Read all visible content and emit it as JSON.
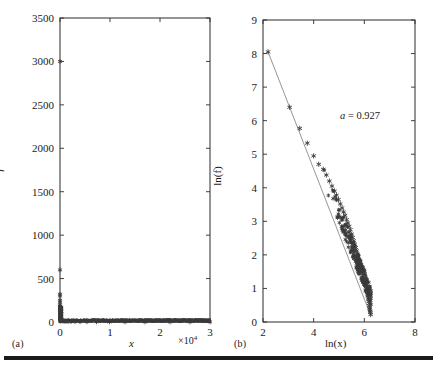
{
  "figure": {
    "panel_a_label": "(a)",
    "panel_b_label": "(b)"
  },
  "chart_data": [
    {
      "type": "scatter",
      "panel": "(a)",
      "title": "",
      "xlabel": "x",
      "ylabel": "f",
      "x_multiplier": "×10",
      "x_multiplier_exponent": "4",
      "xlim": [
        0,
        30000
      ],
      "ylim": [
        0,
        3500
      ],
      "xticks": [
        0,
        10000,
        20000,
        30000
      ],
      "xticklabels": [
        "0",
        "1",
        "2",
        "3"
      ],
      "yticks": [
        0,
        500,
        1000,
        1500,
        2000,
        2500,
        3000,
        3500
      ],
      "yticklabels": [
        "0",
        "500",
        "1000",
        "1500",
        "2000",
        "2500",
        "3000",
        "3500"
      ],
      "grid": false,
      "legend": "none",
      "marker": "star",
      "marker_color": "#3a3a3a",
      "description": "Rank-frequency distribution: frequency f versus rank x, heavy-tailed decay",
      "x": [
        1,
        2,
        3,
        4,
        5,
        6,
        7,
        8,
        9,
        10,
        12,
        14,
        17,
        20,
        25,
        30,
        40,
        55,
        75,
        100,
        140,
        190,
        260,
        350,
        470,
        640,
        870,
        1200,
        1600,
        2200,
        3000,
        4000,
        5400,
        7300,
        9900,
        13000,
        17000,
        22000,
        26000,
        30000
      ],
      "values": [
        3000,
        600,
        320,
        300,
        250,
        230,
        200,
        185,
        170,
        155,
        140,
        125,
        110,
        100,
        88,
        78,
        66,
        55,
        45,
        37,
        30,
        25,
        20,
        17,
        14,
        11,
        9,
        7,
        6,
        5,
        4,
        3,
        2.5,
        2,
        1.6,
        1.3,
        1.1,
        1,
        1,
        1
      ]
    },
    {
      "type": "scatter",
      "panel": "(b)",
      "title": "",
      "xlabel": "ln(x)",
      "ylabel": "ln(f)",
      "xlim": [
        2,
        8
      ],
      "ylim": [
        0,
        9
      ],
      "xticks": [
        2,
        4,
        6,
        8
      ],
      "xticklabels": [
        "2",
        "4",
        "6",
        "8"
      ],
      "yticks": [
        0,
        1,
        2,
        3,
        4,
        5,
        6,
        7,
        8,
        9
      ],
      "yticklabels": [
        "0",
        "1",
        "2",
        "3",
        "4",
        "5",
        "6",
        "7",
        "8",
        "9"
      ],
      "grid": false,
      "legend": "none",
      "marker": "star",
      "marker_color": "#3a3a3a",
      "fit_line_color": "#8a8a8a",
      "annotation": {
        "variable": "a",
        "equals": " = ",
        "value": "0.927"
      },
      "annotation_text": "a = 0.927",
      "fit": {
        "x": [
          2.2,
          6.25
        ],
        "y": [
          8.05,
          0.2
        ]
      },
      "x": [
        2.2,
        3.05,
        3.45,
        3.75,
        4.0,
        4.2,
        4.38,
        4.5,
        4.62,
        4.72,
        4.82,
        4.9,
        4.98,
        5.05,
        5.12,
        5.18,
        5.24,
        5.3,
        5.35,
        5.4,
        5.45,
        5.5,
        5.54,
        5.58,
        5.62,
        5.66,
        5.7,
        5.73,
        5.76,
        5.79,
        5.82,
        5.85,
        5.88,
        5.9,
        5.93,
        5.95,
        5.98,
        6.0,
        6.02,
        6.04,
        6.06,
        6.08,
        6.1,
        6.11,
        6.13,
        6.14,
        6.16,
        6.17,
        6.18,
        6.19,
        6.2,
        6.21,
        6.22,
        6.23,
        6.24,
        6.25
      ],
      "values": [
        8.05,
        6.4,
        5.77,
        5.33,
        4.95,
        4.7,
        4.55,
        4.38,
        4.2,
        4.05,
        3.9,
        3.78,
        3.65,
        3.52,
        3.4,
        3.28,
        3.18,
        3.05,
        2.95,
        2.85,
        2.75,
        2.62,
        2.52,
        2.42,
        2.32,
        2.22,
        2.12,
        2.02,
        1.95,
        1.85,
        1.78,
        1.7,
        1.62,
        1.55,
        1.48,
        1.4,
        1.32,
        1.25,
        1.18,
        1.12,
        1.05,
        0.98,
        0.92,
        0.88,
        0.82,
        0.78,
        0.72,
        0.68,
        0.62,
        0.55,
        0.48,
        0.42,
        0.38,
        0.32,
        0.28,
        0.22
      ]
    }
  ]
}
